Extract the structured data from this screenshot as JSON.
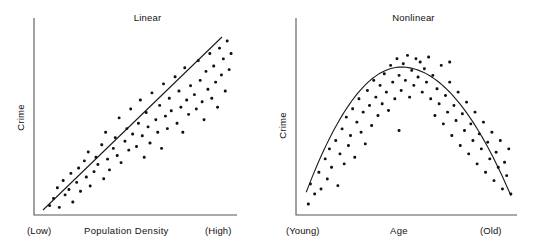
{
  "figure": {
    "background": "#ffffff",
    "dot_color": "#111111",
    "line_color": "#1a1a1a",
    "axis_color": "#555555"
  },
  "chart_data": [
    {
      "type": "scatter",
      "title": "Linear",
      "xlabel": "Population Density",
      "ylabel": "Crime",
      "xtick_labels": [
        "(Low)",
        "(High)"
      ],
      "ytick_labels": [],
      "grid": false,
      "legend": false,
      "xlim": [
        0,
        100
      ],
      "ylim": [
        0,
        100
      ],
      "trend": {
        "kind": "line",
        "description": "straight positive-slope best-fit line",
        "x": [
          5,
          100
        ],
        "y": [
          4,
          96
        ]
      },
      "points": [
        [
          5,
          3
        ],
        [
          7,
          7
        ],
        [
          9,
          13
        ],
        [
          10,
          2
        ],
        [
          12,
          17
        ],
        [
          13,
          9
        ],
        [
          15,
          12
        ],
        [
          16,
          21
        ],
        [
          17,
          5
        ],
        [
          19,
          16
        ],
        [
          20,
          24
        ],
        [
          21,
          11
        ],
        [
          23,
          28
        ],
        [
          24,
          19
        ],
        [
          25,
          33
        ],
        [
          26,
          14
        ],
        [
          28,
          22
        ],
        [
          29,
          30
        ],
        [
          30,
          26
        ],
        [
          32,
          37
        ],
        [
          33,
          18
        ],
        [
          34,
          44
        ],
        [
          35,
          29
        ],
        [
          36,
          23
        ],
        [
          38,
          35
        ],
        [
          39,
          41
        ],
        [
          40,
          31
        ],
        [
          41,
          52
        ],
        [
          42,
          27
        ],
        [
          44,
          39
        ],
        [
          45,
          46
        ],
        [
          46,
          34
        ],
        [
          47,
          57
        ],
        [
          48,
          43
        ],
        [
          50,
          36
        ],
        [
          51,
          49
        ],
        [
          52,
          62
        ],
        [
          53,
          42
        ],
        [
          54,
          30
        ],
        [
          55,
          55
        ],
        [
          56,
          47
        ],
        [
          57,
          38
        ],
        [
          58,
          66
        ],
        [
          60,
          51
        ],
        [
          61,
          44
        ],
        [
          62,
          59
        ],
        [
          63,
          35
        ],
        [
          64,
          71
        ],
        [
          65,
          53
        ],
        [
          66,
          46
        ],
        [
          67,
          63
        ],
        [
          68,
          56
        ],
        [
          70,
          75
        ],
        [
          71,
          49
        ],
        [
          72,
          67
        ],
        [
          73,
          58
        ],
        [
          74,
          44
        ],
        [
          75,
          80
        ],
        [
          76,
          62
        ],
        [
          77,
          54
        ],
        [
          78,
          70
        ],
        [
          80,
          65
        ],
        [
          81,
          57
        ],
        [
          82,
          84
        ],
        [
          83,
          73
        ],
        [
          84,
          61
        ],
        [
          85,
          51
        ],
        [
          86,
          78
        ],
        [
          87,
          68
        ],
        [
          88,
          88
        ],
        [
          89,
          63
        ],
        [
          90,
          81
        ],
        [
          91,
          72
        ],
        [
          92,
          58
        ],
        [
          93,
          91
        ],
        [
          94,
          76
        ],
        [
          95,
          85
        ],
        [
          96,
          67
        ],
        [
          97,
          95
        ],
        [
          98,
          79
        ],
        [
          99,
          88
        ]
      ]
    },
    {
      "type": "scatter",
      "title": "Nonlinear",
      "xlabel": "Age",
      "ylabel": "Crime",
      "xtick_labels": [
        "(Young)",
        "(Old)"
      ],
      "ytick_labels": [],
      "grid": false,
      "legend": false,
      "xlim": [
        0,
        100
      ],
      "ylim": [
        0,
        100
      ],
      "trend": {
        "kind": "parabola",
        "description": "inverted-U quadratic best-fit curve peaking near mid-range",
        "vertex_x": 47,
        "vertex_y": 85,
        "x_start": 2,
        "y_start": 10,
        "x_end": 99,
        "y_end": 8
      },
      "points": [
        [
          3,
          3
        ],
        [
          4,
          15
        ],
        [
          6,
          9
        ],
        [
          8,
          22
        ],
        [
          9,
          12
        ],
        [
          11,
          30
        ],
        [
          12,
          18
        ],
        [
          13,
          36
        ],
        [
          14,
          25
        ],
        [
          16,
          41
        ],
        [
          17,
          14
        ],
        [
          18,
          33
        ],
        [
          19,
          48
        ],
        [
          20,
          27
        ],
        [
          21,
          55
        ],
        [
          22,
          38
        ],
        [
          23,
          44
        ],
        [
          24,
          60
        ],
        [
          25,
          31
        ],
        [
          26,
          52
        ],
        [
          27,
          66
        ],
        [
          28,
          46
        ],
        [
          29,
          58
        ],
        [
          30,
          39
        ],
        [
          31,
          71
        ],
        [
          32,
          62
        ],
        [
          33,
          50
        ],
        [
          34,
          77
        ],
        [
          35,
          67
        ],
        [
          36,
          56
        ],
        [
          37,
          74
        ],
        [
          38,
          63
        ],
        [
          39,
          81
        ],
        [
          40,
          70
        ],
        [
          41,
          59
        ],
        [
          42,
          86
        ],
        [
          43,
          76
        ],
        [
          44,
          66
        ],
        [
          45,
          90
        ],
        [
          46,
          80
        ],
        [
          47,
          71
        ],
        [
          48,
          87
        ],
        [
          49,
          77
        ],
        [
          50,
          92
        ],
        [
          51,
          67
        ],
        [
          52,
          83
        ],
        [
          53,
          74
        ],
        [
          54,
          90
        ],
        [
          55,
          79
        ],
        [
          56,
          88
        ],
        [
          57,
          70
        ],
        [
          58,
          84
        ],
        [
          59,
          76
        ],
        [
          60,
          91
        ],
        [
          61,
          66
        ],
        [
          62,
          80
        ],
        [
          63,
          56
        ],
        [
          64,
          72
        ],
        [
          65,
          63
        ],
        [
          66,
          86
        ],
        [
          67,
          51
        ],
        [
          68,
          68
        ],
        [
          69,
          58
        ],
        [
          70,
          76
        ],
        [
          71,
          44
        ],
        [
          72,
          62
        ],
        [
          73,
          53
        ],
        [
          74,
          70
        ],
        [
          75,
          38
        ],
        [
          76,
          57
        ],
        [
          77,
          47
        ],
        [
          78,
          64
        ],
        [
          79,
          33
        ],
        [
          80,
          51
        ],
        [
          81,
          41
        ],
        [
          82,
          58
        ],
        [
          83,
          27
        ],
        [
          84,
          45
        ],
        [
          85,
          36
        ],
        [
          86,
          52
        ],
        [
          87,
          22
        ],
        [
          88,
          40
        ],
        [
          89,
          30
        ],
        [
          90,
          46
        ],
        [
          91,
          17
        ],
        [
          92,
          34
        ],
        [
          93,
          25
        ],
        [
          94,
          41
        ],
        [
          95,
          12
        ],
        [
          96,
          28
        ],
        [
          97,
          20
        ],
        [
          98,
          36
        ],
        [
          99,
          9
        ],
        [
          46,
          47
        ],
        [
          70,
          88
        ]
      ]
    }
  ],
  "panels": [
    {
      "name": "linear",
      "title": "Linear",
      "ylabel": "Crime",
      "xlabel": "Population Density",
      "xtick_low": "(Low)",
      "xtick_high": "(High)"
    },
    {
      "name": "nonlinear",
      "title": "Nonlinear",
      "ylabel": "Crime",
      "xlabel": "Age",
      "xtick_low": "(Young)",
      "xtick_high": "(Old)"
    }
  ]
}
